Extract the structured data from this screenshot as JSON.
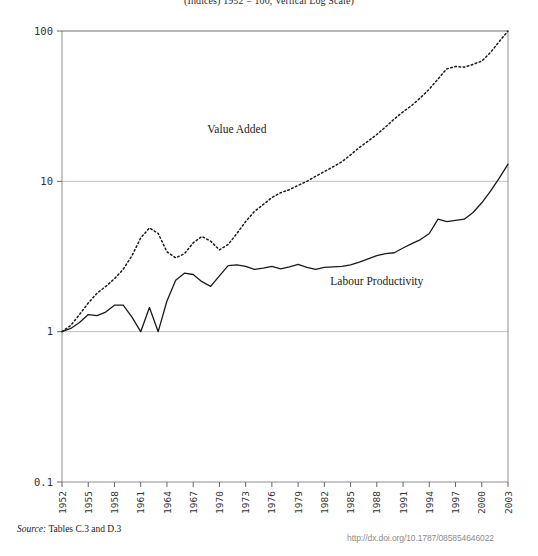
{
  "chart_data": {
    "type": "line",
    "title": "(Indices) 1952 = 100, Vertical Log Scale)",
    "xlabel": "",
    "ylabel": "",
    "yscale": "log",
    "ylim": [
      0.1,
      100
    ],
    "y_ticks": [
      "0.1",
      "1",
      "10",
      "100"
    ],
    "y_tick_values": [
      0.1,
      1,
      10,
      100
    ],
    "grid": "horizontal",
    "legend_position": "inline-annotations",
    "x_range": [
      1952,
      2003
    ],
    "x_tick_labels": [
      "1952",
      "1955",
      "1958",
      "1961",
      "1964",
      "1967",
      "1970",
      "1973",
      "1976",
      "1979",
      "1982",
      "1985",
      "1988",
      "1991",
      "1994",
      "1997",
      "2000",
      "2003"
    ],
    "x_tick_values": [
      1952,
      1955,
      1958,
      1961,
      1964,
      1967,
      1970,
      1973,
      1976,
      1979,
      1982,
      1985,
      1988,
      1991,
      1994,
      1997,
      2000,
      2003
    ],
    "x": [
      1952,
      1953,
      1954,
      1955,
      1956,
      1957,
      1958,
      1959,
      1960,
      1961,
      1962,
      1963,
      1964,
      1965,
      1966,
      1967,
      1968,
      1969,
      1970,
      1971,
      1972,
      1973,
      1974,
      1975,
      1976,
      1977,
      1978,
      1979,
      1980,
      1981,
      1982,
      1983,
      1984,
      1985,
      1986,
      1987,
      1988,
      1989,
      1990,
      1991,
      1992,
      1993,
      1994,
      1995,
      1996,
      1997,
      1998,
      1999,
      2000,
      2001,
      2002,
      2003
    ],
    "series": [
      {
        "name": "Value Added",
        "style": "dotted",
        "color": "#1a1a1a",
        "label_text": "Value Added",
        "values": [
          1.0,
          1.1,
          1.3,
          1.55,
          1.8,
          2.0,
          2.25,
          2.6,
          3.2,
          4.2,
          4.9,
          4.5,
          3.4,
          3.1,
          3.3,
          3.9,
          4.3,
          4.0,
          3.5,
          3.8,
          4.5,
          5.4,
          6.3,
          7.0,
          7.8,
          8.4,
          8.8,
          9.4,
          10.0,
          10.8,
          11.6,
          12.5,
          13.5,
          15.0,
          16.8,
          18.5,
          20.5,
          23.0,
          26.0,
          29.0,
          32.0,
          36.0,
          41.0,
          48.0,
          56.0,
          58.0,
          57.5,
          60.0,
          63.0,
          72.0,
          85.0,
          100.0
        ]
      },
      {
        "name": "Labour Productivity",
        "style": "solid",
        "color": "#1a1a1a",
        "label_text": "Labour Productivity",
        "values": [
          1.0,
          1.05,
          1.15,
          1.3,
          1.28,
          1.35,
          1.5,
          1.5,
          1.25,
          1.0,
          1.45,
          1.0,
          1.6,
          2.2,
          2.45,
          2.4,
          2.15,
          2.0,
          2.35,
          2.75,
          2.78,
          2.72,
          2.6,
          2.65,
          2.72,
          2.62,
          2.7,
          2.8,
          2.68,
          2.6,
          2.68,
          2.7,
          2.72,
          2.78,
          2.9,
          3.05,
          3.2,
          3.3,
          3.35,
          3.6,
          3.85,
          4.1,
          4.5,
          5.6,
          5.4,
          5.5,
          5.6,
          6.2,
          7.2,
          8.6,
          10.5,
          13.0
        ]
      }
    ],
    "annotations": [
      {
        "text": "Value Added",
        "x": 1972,
        "y": 21
      },
      {
        "text": "Labour Productivity",
        "x": 1988,
        "y": 2.05
      }
    ]
  },
  "footer": {
    "source_word": "Source:",
    "source_text": " Tables C.3 and D.3",
    "doi": "http://dx.doi.org/10.1787/085854646022"
  }
}
